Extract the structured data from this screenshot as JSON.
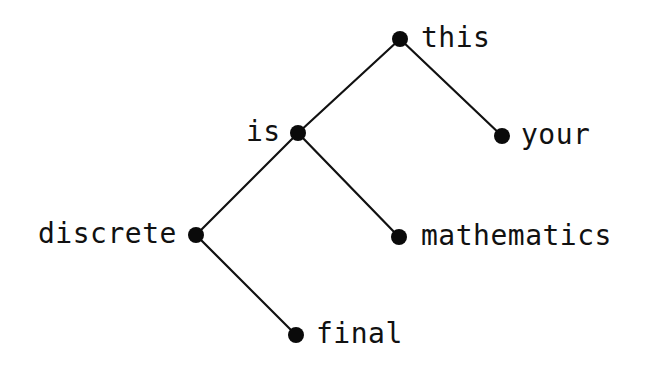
{
  "diagram": {
    "type": "binary-tree",
    "colors": {
      "node": "#0a0a0a",
      "edge": "#111111",
      "text": "#111111",
      "background": "#ffffff"
    },
    "nodes": [
      {
        "id": "this",
        "label": "this",
        "x": 400,
        "y": 39,
        "label_side": "right"
      },
      {
        "id": "is",
        "label": "is",
        "x": 298,
        "y": 133,
        "label_side": "left"
      },
      {
        "id": "your",
        "label": "your",
        "x": 502,
        "y": 136,
        "label_side": "right"
      },
      {
        "id": "discrete",
        "label": "discrete",
        "x": 196,
        "y": 235,
        "label_side": "left"
      },
      {
        "id": "mathematics",
        "label": "mathematics",
        "x": 399,
        "y": 237,
        "label_side": "right"
      },
      {
        "id": "final",
        "label": "final",
        "x": 296,
        "y": 335,
        "label_side": "right"
      }
    ],
    "edges": [
      {
        "from": "this",
        "to": "is"
      },
      {
        "from": "this",
        "to": "your"
      },
      {
        "from": "is",
        "to": "discrete"
      },
      {
        "from": "is",
        "to": "mathematics"
      },
      {
        "from": "discrete",
        "to": "final"
      }
    ]
  }
}
